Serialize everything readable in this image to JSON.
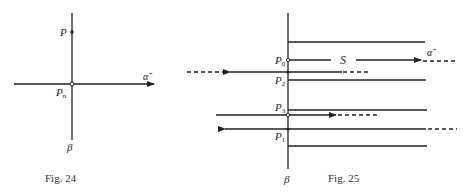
{
  "fig24": {
    "caption": "Fig. 24",
    "labels": {
      "P": "P",
      "Pn_main": "P",
      "Pn_sub": "n",
      "alpha": "α",
      "alpha_sup": "+",
      "beta": "β"
    }
  },
  "fig25": {
    "caption": "Fig. 25",
    "labels": {
      "P0_main": "P",
      "P0_sub": "0",
      "P2_main": "P",
      "P2_sub": "2",
      "P3_main": "P",
      "P3_sub": "3",
      "P1_main": "P",
      "P1_sub": "1",
      "S": "S",
      "alpha": "α",
      "alpha_sup": "+",
      "beta": "β"
    }
  }
}
